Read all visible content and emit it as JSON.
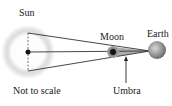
{
  "diagram": {
    "labels": {
      "sun": "Sun",
      "moon": "Moon",
      "earth": "Earth",
      "umbra": "Umbra",
      "scale_note": "Not to scale"
    },
    "colors": {
      "sun_glow": "#d8d8d8",
      "lines": "#333333",
      "umbra_fill": "#9a9a9a",
      "moon": "#555555",
      "earth": "#8a8a8a"
    }
  }
}
